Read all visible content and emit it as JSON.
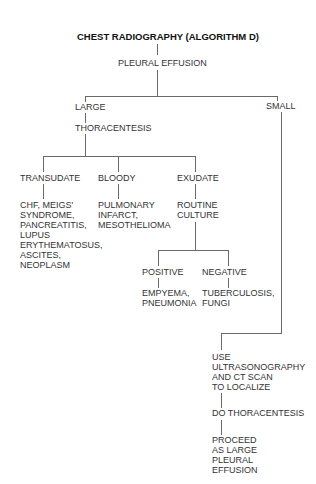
{
  "diagram": {
    "title": "CHEST RADIOGRAPHY (ALGORITHM D)",
    "root": "PLEURAL EFFUSION",
    "large": {
      "label": "LARGE",
      "step": "THORACENTESIS",
      "branches": {
        "transudate": {
          "label": "TRANSUDATE",
          "result": [
            "CHF, MEIGS'",
            "SYNDROME,",
            "PANCREATITIS,",
            "LUPUS",
            "ERYTHEMATOSUS,",
            "ASCITES,",
            "NEOPLASM"
          ]
        },
        "bloody": {
          "label": "BLOODY",
          "result": [
            "PULMONARY",
            "INFARCT,",
            "MESOTHELIOMA"
          ]
        },
        "exudate": {
          "label": "EXUDATE",
          "step": [
            "ROUTINE",
            "CULTURE"
          ],
          "positive": {
            "label": "POSITIVE",
            "result": [
              "EMPYEMA,",
              "PNEUMONIA"
            ]
          },
          "negative": {
            "label": "NEGATIVE",
            "result": [
              "TUBERCULOSIS,",
              "FUNGI"
            ]
          }
        }
      }
    },
    "small": {
      "label": "SMALL",
      "step1": [
        "USE",
        "ULTRASONOGRAPHY",
        "AND CT SCAN",
        "TO LOCALIZE"
      ],
      "step2": "DO THORACENTESIS",
      "step3": [
        "PROCEED",
        "AS LARGE",
        "PLEURAL",
        "EFFUSION"
      ]
    }
  }
}
